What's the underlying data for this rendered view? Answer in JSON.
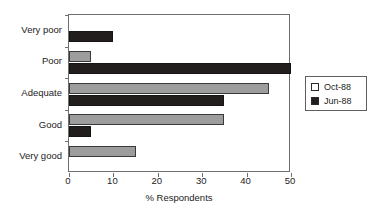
{
  "chart_data": {
    "type": "bar",
    "orientation": "horizontal",
    "title": "",
    "xlabel": "% Respondents",
    "ylabel": "",
    "categories": [
      "Very poor",
      "Poor",
      "Adequate",
      "Good",
      "Very good"
    ],
    "series": [
      {
        "name": "Oct-88",
        "values": [
          0,
          5,
          45,
          35,
          15
        ],
        "color": "#9d9d9d"
      },
      {
        "name": "Jun-88",
        "values": [
          10,
          50,
          35,
          5,
          0
        ],
        "color": "#231e1e"
      }
    ],
    "xlim": [
      0,
      50
    ],
    "xticks": [
      0,
      10,
      20,
      30,
      40,
      50
    ],
    "xtick_labels": [
      "0",
      "10",
      "20",
      "30",
      "40",
      "50"
    ],
    "grid": false,
    "legend_position": "right"
  },
  "legend": {
    "entries": [
      {
        "label": "Oct-88",
        "swatch": "white-square-icon"
      },
      {
        "label": "Jun-88",
        "swatch": "black-square-icon"
      }
    ]
  }
}
